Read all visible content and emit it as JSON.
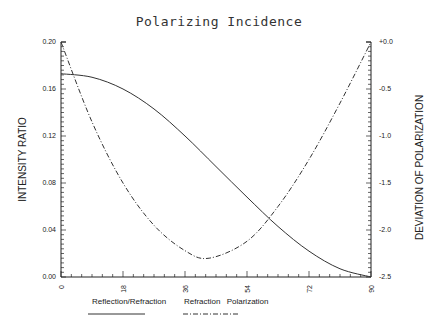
{
  "chart_data": {
    "type": "line",
    "title": "Polarizing Incidence",
    "xlabel": "",
    "ylabel": "INTENSITY RATIO",
    "y2label": "DEVIATION OF POLARIZATION",
    "xlim": [
      0,
      90
    ],
    "ylim": [
      0.0,
      0.2
    ],
    "y2lim": [
      -2.5,
      0.0
    ],
    "x_ticks": [
      "0",
      "18",
      "36",
      "54",
      "72",
      "90"
    ],
    "y_ticks": [
      "0.00",
      "0.04",
      "0.08",
      "0.12",
      "0.16",
      "0.20"
    ],
    "y2_ticks": [
      "-2.5",
      "-2.0",
      "-1.5",
      "-1.0",
      "-0.5",
      "+0.0"
    ],
    "grid": false,
    "legend_position": "bottom",
    "series": [
      {
        "name": "Reflection/Refraction",
        "style": "solid",
        "axis": "left",
        "x": [
          0,
          9,
          18,
          27,
          36,
          45,
          54,
          63,
          72,
          81,
          90
        ],
        "values": [
          0.173,
          0.17,
          0.16,
          0.143,
          0.12,
          0.094,
          0.068,
          0.043,
          0.022,
          0.007,
          0.0
        ]
      },
      {
        "name": "Refraction Polarization",
        "style": "dash-dot",
        "axis": "right",
        "x": [
          0,
          9,
          18,
          27,
          36,
          43,
          54,
          63,
          72,
          81,
          90
        ],
        "values": [
          0.0,
          -0.85,
          -1.5,
          -1.95,
          -2.22,
          -2.3,
          -2.12,
          -1.75,
          -1.25,
          -0.65,
          0.0
        ]
      }
    ]
  }
}
